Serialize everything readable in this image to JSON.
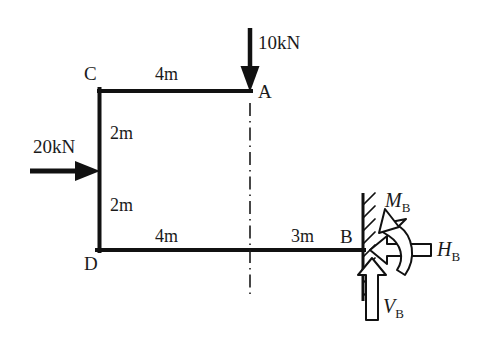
{
  "figure": {
    "background_color": "#ffffff",
    "line_color": "#111111",
    "text_color": "#1a1a1a"
  },
  "nodes": {
    "A": "A",
    "B": "B",
    "C": "C",
    "D": "D"
  },
  "dimensions": {
    "top_span": "4m",
    "upper_column": "2m",
    "lower_column": "2m",
    "bottom_left_span": "4m",
    "bottom_right_span": "3m"
  },
  "loads": {
    "vertical_point_load": "10kN",
    "horizontal_point_load": "20kN"
  },
  "reactions": {
    "moment_symbol": "M",
    "moment_sub": "B",
    "horizontal_symbol": "H",
    "horizontal_sub": "B",
    "vertical_symbol": "V",
    "vertical_sub": "B"
  },
  "geometry": {
    "point_A": [
      250,
      91
    ],
    "point_B": [
      363,
      250
    ],
    "point_C": [
      99,
      91
    ],
    "point_D": [
      99,
      250
    ],
    "load_20kn_apply": [
      99,
      171
    ],
    "wall_x": 363,
    "wall_top": 193,
    "wall_bottom": 301,
    "centerline_x": 250
  }
}
